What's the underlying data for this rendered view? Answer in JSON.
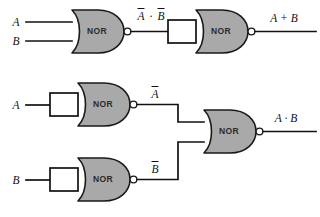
{
  "diagram": {
    "colors": {
      "gate_fill": "#a9a9a9",
      "outline": "#1a1a1a",
      "wire": "#111111",
      "background": "#ffffff",
      "short_rect_fill": "#ffffff"
    },
    "gates": [
      {
        "id": "nor1",
        "label": "NOR",
        "inputs": [
          "A",
          "B"
        ],
        "output": "Ā · B̄",
        "shorted_inputs": false
      },
      {
        "id": "nor2",
        "label": "NOR",
        "inputs": [
          "Ā · B̄"
        ],
        "output": "A + B",
        "shorted_inputs": true
      },
      {
        "id": "nor3",
        "label": "NOR",
        "inputs": [
          "A"
        ],
        "output": "Ā",
        "shorted_inputs": true
      },
      {
        "id": "nor4",
        "label": "NOR",
        "inputs": [
          "B"
        ],
        "output": "B̄",
        "shorted_inputs": true
      },
      {
        "id": "nor5",
        "label": "NOR",
        "inputs": [
          "Ā",
          "B̄"
        ],
        "output": "A · B",
        "shorted_inputs": false
      }
    ],
    "input_labels": [
      {
        "id": "in-a-top",
        "text": "A"
      },
      {
        "id": "in-b-top",
        "text": "B"
      },
      {
        "id": "in-a-mid",
        "text": "A"
      },
      {
        "id": "in-b-bot",
        "text": "B"
      }
    ],
    "signal_labels": [
      {
        "id": "sig-nand-out",
        "base": "A",
        "operator": "·",
        "base2": "B",
        "overbars": "both"
      },
      {
        "id": "sig-or-out",
        "text": "A + B",
        "overbars": "none"
      },
      {
        "id": "sig-not-a",
        "base": "A",
        "overbars": "single"
      },
      {
        "id": "sig-not-b",
        "base": "B",
        "overbars": "single"
      },
      {
        "id": "sig-and-out",
        "text": "A · B",
        "overbars": "none"
      }
    ],
    "text": {
      "nor": "NOR",
      "a": "A",
      "b": "B",
      "or_out": "A + B",
      "and_out": "A · B",
      "dot": "·",
      "plus": "+"
    }
  }
}
